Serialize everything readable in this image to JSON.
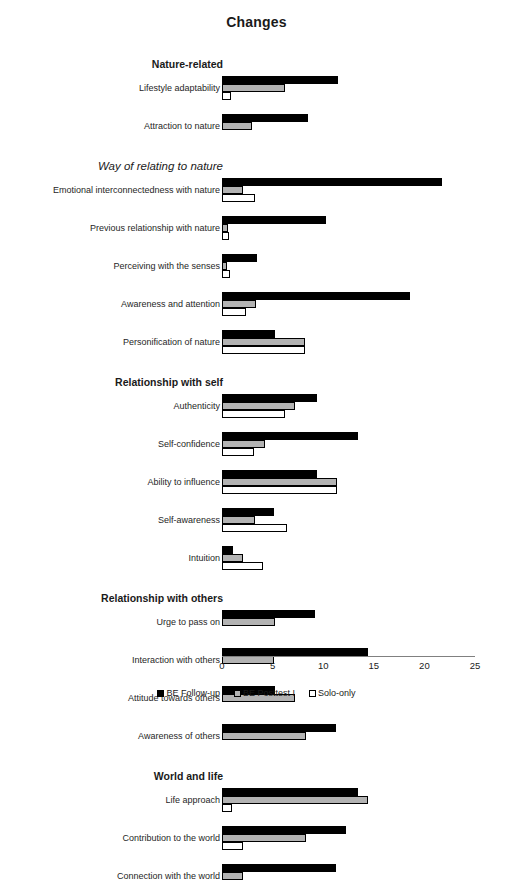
{
  "chart_data": {
    "type": "bar",
    "orientation": "horizontal",
    "title": "Changes",
    "xlabel": "",
    "ylabel": "",
    "xlim": [
      0,
      25
    ],
    "xticks": [
      0,
      5,
      10,
      15,
      20,
      25
    ],
    "grid": false,
    "legend_position": "bottom",
    "series": [
      {
        "name": "BE Follow-up",
        "color": "#000000"
      },
      {
        "name": "BE Posttest I",
        "color": "#b3b3b3"
      },
      {
        "name": "Solo-only",
        "color": "#ffffff"
      }
    ],
    "groups": [
      {
        "heading": "Nature-related",
        "heading_style": "bold",
        "items": [
          {
            "label": "Lifestyle adaptability",
            "values": [
              11.5,
              6.2,
              0.9
            ]
          },
          {
            "label": "Attraction to nature",
            "values": [
              8.5,
              3.0,
              0.0
            ]
          }
        ]
      },
      {
        "heading": "Way of relating to nature",
        "heading_style": "italic",
        "items": [
          {
            "label": "Emotional interconnectedness with nature",
            "values": [
              21.7,
              2.1,
              3.3
            ]
          },
          {
            "label": "Previous relationship with nature",
            "values": [
              10.3,
              0.6,
              0.7
            ]
          },
          {
            "label": "Perceiving with the senses",
            "values": [
              3.5,
              0.5,
              0.8
            ]
          },
          {
            "label": "Awareness and attention",
            "values": [
              18.6,
              3.4,
              2.4
            ]
          },
          {
            "label": "Personification of nature",
            "values": [
              5.2,
              8.2,
              8.2
            ]
          }
        ]
      },
      {
        "heading": "Relationship with self",
        "heading_style": "bold",
        "items": [
          {
            "label": "Authenticity",
            "values": [
              9.4,
              7.2,
              6.2
            ]
          },
          {
            "label": "Self-confidence",
            "values": [
              13.4,
              4.2,
              3.2
            ]
          },
          {
            "label": "Ability to influence",
            "values": [
              9.4,
              11.4,
              11.4
            ]
          },
          {
            "label": "Self-awareness",
            "values": [
              5.1,
              3.3,
              6.4
            ]
          },
          {
            "label": "Intuition",
            "values": [
              1.1,
              2.1,
              4.1
            ]
          }
        ]
      },
      {
        "heading": "Relationship with others",
        "heading_style": "bold",
        "items": [
          {
            "label": "Urge to pass on",
            "values": [
              9.2,
              5.2,
              0.0
            ]
          },
          {
            "label": "Interaction with others",
            "values": [
              14.4,
              5.1,
              0.0
            ]
          },
          {
            "label": "Attitude towards others",
            "values": [
              5.2,
              7.2,
              0.0
            ]
          },
          {
            "label": "Awareness of others",
            "values": [
              11.3,
              8.3,
              0.0
            ]
          }
        ]
      },
      {
        "heading": "World and life",
        "heading_style": "bold",
        "items": [
          {
            "label": "Life approach",
            "values": [
              13.4,
              14.4,
              1.0
            ]
          },
          {
            "label": "Contribution to the world",
            "values": [
              12.3,
              8.3,
              2.1
            ]
          },
          {
            "label": "Connection with the world",
            "values": [
              11.3,
              2.1,
              0.0
            ]
          }
        ]
      }
    ]
  },
  "title": "Changes",
  "axis": {
    "ticks": [
      "0",
      "5",
      "10",
      "15",
      "20",
      "25"
    ]
  },
  "legend": {
    "items": [
      {
        "label": "BE Follow-up"
      },
      {
        "label": "BE Posttest I"
      },
      {
        "label": "Solo-only"
      }
    ]
  }
}
